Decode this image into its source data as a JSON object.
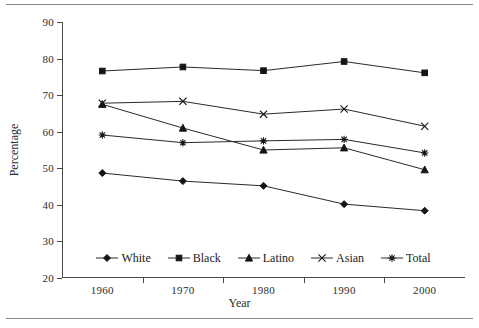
{
  "figure": {
    "top_rule": true,
    "bottom_rule": true
  },
  "chart_data": {
    "type": "line",
    "title": "",
    "xlabel": "Year",
    "ylabel": "Percentage",
    "categories": [
      "1960",
      "1970",
      "1980",
      "1990",
      "2000"
    ],
    "x": [
      1960,
      1970,
      1980,
      1990,
      2000
    ],
    "ylim": [
      20,
      90
    ],
    "yticks": [
      20,
      30,
      40,
      50,
      60,
      70,
      80,
      90
    ],
    "ytick_labels": [
      "20",
      "30",
      "40",
      "50",
      "60",
      "70",
      "80",
      "90"
    ],
    "grid": false,
    "legend_position": "inside-bottom-center",
    "series": [
      {
        "name": "White",
        "marker": "diamond",
        "values": [
          48.7,
          46.5,
          45.2,
          40.2,
          38.4
        ]
      },
      {
        "name": "Black",
        "marker": "square",
        "values": [
          76.6,
          77.7,
          76.7,
          79.2,
          76.1
        ]
      },
      {
        "name": "Latino",
        "marker": "triangle",
        "values": [
          67.5,
          61.0,
          55.0,
          55.6,
          49.6
        ]
      },
      {
        "name": "Asian",
        "marker": "cross",
        "values": [
          67.8,
          68.3,
          64.8,
          66.2,
          61.5
        ]
      },
      {
        "name": "Total",
        "marker": "asterisk",
        "values": [
          59.1,
          57.0,
          57.5,
          57.9,
          54.2
        ]
      }
    ],
    "colors": {
      "line": "#2a2a2a",
      "marker": "#151515",
      "axis": "#4a4a4a",
      "text": "#2b2b2b",
      "background": "#ffffff"
    }
  }
}
